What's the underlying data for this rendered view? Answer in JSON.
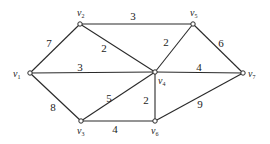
{
  "graph": {
    "nodes": [
      {
        "id": "v1",
        "name": "v",
        "sub": "1",
        "x": 30,
        "y": 73,
        "lx": 13,
        "ly": 77
      },
      {
        "id": "v2",
        "name": "v",
        "sub": "2",
        "x": 80,
        "y": 24,
        "lx": 77,
        "ly": 16
      },
      {
        "id": "v3",
        "name": "v",
        "sub": "3",
        "x": 81,
        "y": 121,
        "lx": 77,
        "ly": 134
      },
      {
        "id": "v4",
        "name": "v",
        "sub": "4",
        "x": 155,
        "y": 72,
        "lx": 158,
        "ly": 84
      },
      {
        "id": "v5",
        "name": "v",
        "sub": "5",
        "x": 193,
        "y": 24,
        "lx": 190,
        "ly": 16
      },
      {
        "id": "v6",
        "name": "v",
        "sub": "6",
        "x": 155,
        "y": 121,
        "lx": 151,
        "ly": 134
      },
      {
        "id": "v7",
        "name": "v",
        "sub": "7",
        "x": 243,
        "y": 73,
        "lx": 248,
        "ly": 77
      }
    ],
    "edges": [
      {
        "from": "v1",
        "to": "v2",
        "weight": "7",
        "lx": 49,
        "ly": 47
      },
      {
        "from": "v1",
        "to": "v4",
        "weight": "3",
        "lx": 80,
        "ly": 71
      },
      {
        "from": "v1",
        "to": "v3",
        "weight": "8",
        "lx": 53,
        "ly": 111
      },
      {
        "from": "v2",
        "to": "v5",
        "weight": "3",
        "lx": 133,
        "ly": 20
      },
      {
        "from": "v2",
        "to": "v4",
        "weight": "2",
        "lx": 104,
        "ly": 52
      },
      {
        "from": "v5",
        "to": "v4",
        "weight": "2",
        "lx": 166,
        "ly": 46
      },
      {
        "from": "v5",
        "to": "v7",
        "weight": "6",
        "lx": 221,
        "ly": 47
      },
      {
        "from": "v4",
        "to": "v7",
        "weight": "4",
        "lx": 199,
        "ly": 71
      },
      {
        "from": "v3",
        "to": "v4",
        "weight": "5",
        "lx": 109,
        "ly": 102
      },
      {
        "from": "v4",
        "to": "v6",
        "weight": "2",
        "lx": 146,
        "ly": 104
      },
      {
        "from": "v3",
        "to": "v6",
        "weight": "4",
        "lx": 115,
        "ly": 133
      },
      {
        "from": "v6",
        "to": "v7",
        "weight": "9",
        "lx": 200,
        "ly": 108
      }
    ]
  }
}
